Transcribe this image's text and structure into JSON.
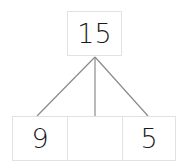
{
  "diagram": {
    "type": "number-bond",
    "whole": {
      "value": "15"
    },
    "parts": [
      {
        "value": "9"
      },
      {
        "value": ""
      },
      {
        "value": "5"
      }
    ],
    "colors": {
      "line": "#8a8a8a",
      "border": "#e2e2e2",
      "text": "#1a1a1a"
    }
  }
}
